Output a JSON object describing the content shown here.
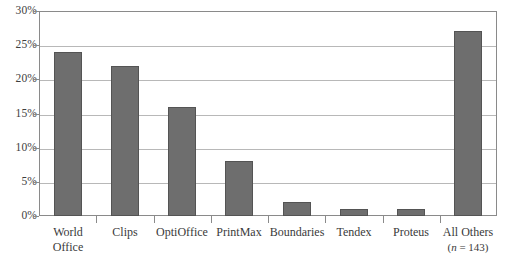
{
  "chart_data": {
    "type": "bar",
    "title": "",
    "subtitle": "",
    "xlabel": "",
    "ylabel": "",
    "categories": [
      "World Office",
      "Clips",
      "OptiOffice",
      "PrintMax",
      "Boundaries",
      "Tendex",
      "Proteus",
      "All Others"
    ],
    "category_lines": [
      [
        "World",
        "Office"
      ],
      [
        "Clips",
        ""
      ],
      [
        "OptiOffice",
        ""
      ],
      [
        "PrintMax",
        ""
      ],
      [
        "Boundaries",
        ""
      ],
      [
        "Tendex",
        ""
      ],
      [
        "Proteus",
        ""
      ],
      [
        "All Others",
        "(n = 143)"
      ]
    ],
    "values": [
      24,
      22,
      16,
      8,
      2,
      1,
      1,
      27
    ],
    "value_labels": [
      "24%",
      "22%",
      "16%",
      "8%",
      "2%",
      "1%",
      "1%",
      "27%"
    ],
    "ylim": [
      0,
      30
    ],
    "ytick_values": [
      0,
      5,
      10,
      15,
      20,
      25,
      30
    ],
    "ytick_labels": [
      "0%",
      "5%",
      "10%",
      "15%",
      "20%",
      "25%",
      "30%"
    ],
    "grid": true,
    "legend": "none",
    "annotations": [
      "(n = 143)"
    ],
    "colors": {
      "bar_fill": "#6e6e6e",
      "bar_border": "#545454",
      "gridline": "#b8b8b8",
      "frame": "#8a8a8a",
      "text": "#3a3a3a",
      "background": "#ffffff"
    }
  }
}
